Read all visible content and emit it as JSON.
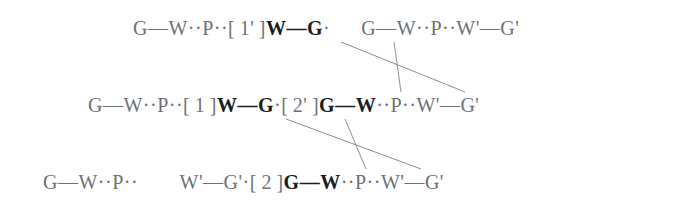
{
  "figure": {
    "type": "chain-crosslink-diagram",
    "background_color": "#ffffff",
    "text_color": "#6e7175",
    "bold_color": "#1c1c1e",
    "link_color": "#8b8e92",
    "rows": [
      {
        "id": "row-1",
        "segments": [
          {
            "kind": "chain",
            "text": "G—W··P··"
          },
          {
            "kind": "index",
            "text": "[ 1' ]"
          },
          {
            "kind": "bold",
            "text": "W—G"
          },
          {
            "kind": "chain",
            "text": "·"
          },
          {
            "kind": "gap",
            "text": "  "
          },
          {
            "kind": "chain",
            "text": "G—W··P··W'—G'"
          }
        ]
      },
      {
        "id": "row-2",
        "segments": [
          {
            "kind": "chain",
            "text": "G—W··P··"
          },
          {
            "kind": "index",
            "text": "[ 1 ]"
          },
          {
            "kind": "bold",
            "text": "W—G"
          },
          {
            "kind": "chain",
            "text": "·"
          },
          {
            "kind": "index",
            "text": "[ 2' ]"
          },
          {
            "kind": "bold",
            "text": "G—W"
          },
          {
            "kind": "chain",
            "text": "··P··W'—G'"
          }
        ]
      },
      {
        "id": "row-3",
        "segments": [
          {
            "kind": "chain",
            "text": "G—W··P··"
          },
          {
            "kind": "gap",
            "text": "   "
          },
          {
            "kind": "chain",
            "text": "W'—G'·"
          },
          {
            "kind": "index",
            "text": "[ 2 ]"
          },
          {
            "kind": "bold",
            "text": "G—W"
          },
          {
            "kind": "chain",
            "text": "··P··W'—G'"
          }
        ]
      }
    ],
    "crosslinks": [
      {
        "id": "link-1",
        "from_row": "row-1",
        "to_row": "row-2",
        "x1": 341,
        "y1": 42,
        "x2": 465,
        "y2": 92
      },
      {
        "id": "link-2",
        "from_row": "row-1",
        "to_row": "row-2",
        "x1": 394,
        "y1": 42,
        "x2": 401,
        "y2": 92
      },
      {
        "id": "link-3",
        "from_row": "row-2",
        "to_row": "row-3",
        "x1": 286,
        "y1": 119,
        "x2": 421,
        "y2": 169
      },
      {
        "id": "link-4",
        "from_row": "row-2",
        "to_row": "row-3",
        "x1": 345,
        "y1": 119,
        "x2": 366,
        "y2": 169
      }
    ]
  }
}
